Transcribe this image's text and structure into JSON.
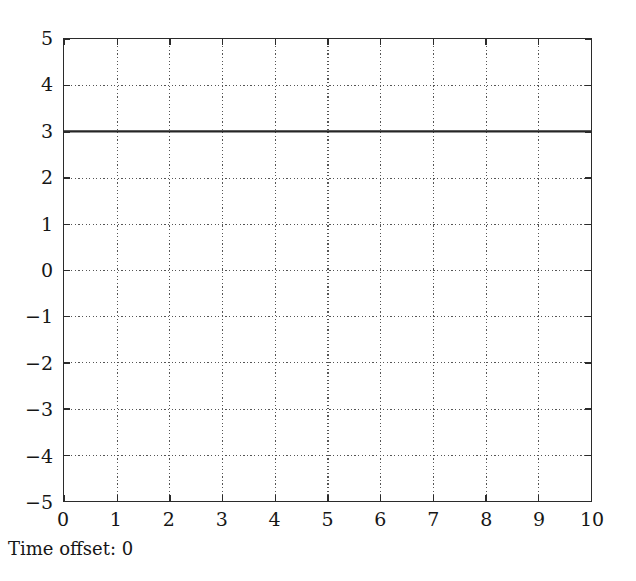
{
  "caption": {
    "text": "Time offset: 0"
  },
  "colors": {
    "background": "#ffffff",
    "frame": "#2b2b2b",
    "grid": "#555555",
    "series": "#262626",
    "text": "#161616"
  },
  "chart_data": {
    "type": "line",
    "title": "",
    "subtitle": "",
    "xlabel": "",
    "ylabel": "",
    "xlim": [
      0,
      10
    ],
    "ylim": [
      -5,
      5
    ],
    "x_ticks": [
      "0",
      "1",
      "2",
      "3",
      "4",
      "5",
      "6",
      "7",
      "8",
      "9",
      "10"
    ],
    "x_tick_values": [
      0,
      1,
      2,
      3,
      4,
      5,
      6,
      7,
      8,
      9,
      10
    ],
    "y_ticks": [
      "5",
      "4",
      "3",
      "2",
      "1",
      "0",
      "−1",
      "−2",
      "−3",
      "−4",
      "−5"
    ],
    "y_tick_values": [
      5,
      4,
      3,
      2,
      1,
      0,
      -1,
      -2,
      -3,
      -4,
      -5
    ],
    "grid": true,
    "grid_style": "dotted",
    "legend": null,
    "legend_position": "none",
    "annotations": [
      "Time offset: 0"
    ],
    "series": [
      {
        "name": "signal",
        "style": "solid",
        "x": [
          0,
          1,
          2,
          3,
          4,
          5,
          6,
          7,
          8,
          9,
          10
        ],
        "values": [
          3,
          3,
          3,
          3,
          3,
          3,
          3,
          3,
          3,
          3,
          3
        ]
      }
    ]
  }
}
